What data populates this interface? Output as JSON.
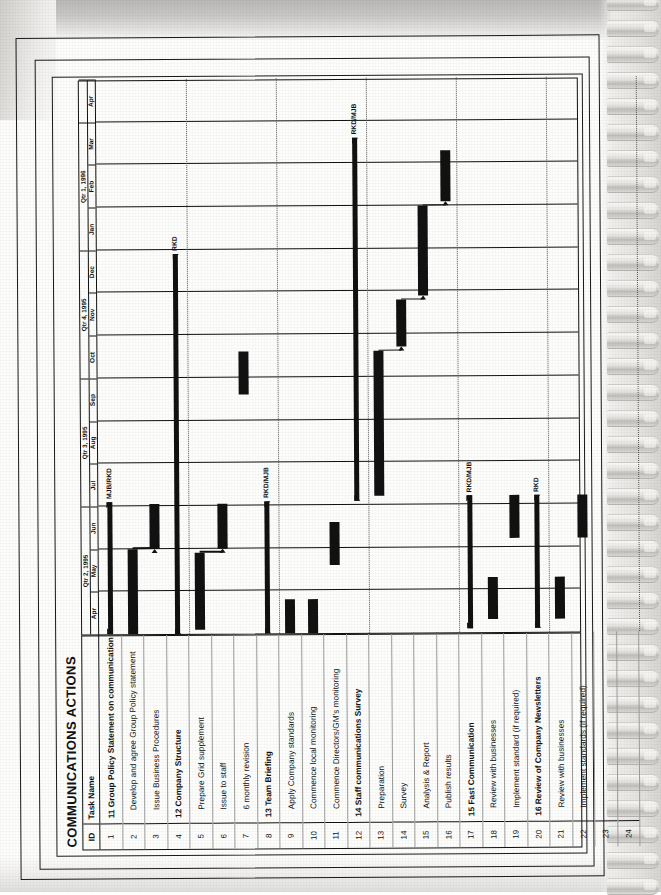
{
  "document": {
    "title": "COMMUNICATIONS ACTIONS",
    "chart_type": "gantt",
    "orientation": "landscape-rotated"
  },
  "table": {
    "columns": [
      "ID",
      "Task Name"
    ],
    "rows": [
      {
        "id": "1",
        "name": "11 Group Policy Statement on communication",
        "kind": "summary"
      },
      {
        "id": "2",
        "name": "Develop and agree Group Policy statement",
        "kind": "task"
      },
      {
        "id": "3",
        "name": "Issue Business Procedures",
        "kind": "task"
      },
      {
        "id": "4",
        "name": "12 Company Structure",
        "kind": "summary"
      },
      {
        "id": "5",
        "name": "Prepare Grid supplement",
        "kind": "task"
      },
      {
        "id": "6",
        "name": "Issue to staff",
        "kind": "task"
      },
      {
        "id": "7",
        "name": "6 monthly revision",
        "kind": "task"
      },
      {
        "id": "8",
        "name": "13 Team Briefing",
        "kind": "summary"
      },
      {
        "id": "9",
        "name": "Apply Company standards",
        "kind": "task"
      },
      {
        "id": "10",
        "name": "Commence local monitoring",
        "kind": "task"
      },
      {
        "id": "11",
        "name": "Commence Directors/GM's monitoring",
        "kind": "task"
      },
      {
        "id": "12",
        "name": "14 Staff communications Survey",
        "kind": "summary"
      },
      {
        "id": "13",
        "name": "Preparation",
        "kind": "task"
      },
      {
        "id": "14",
        "name": "Survey",
        "kind": "task"
      },
      {
        "id": "15",
        "name": "Analysis & Report",
        "kind": "task"
      },
      {
        "id": "16",
        "name": "Publish results",
        "kind": "task"
      },
      {
        "id": "17",
        "name": "15 Fast Communication",
        "kind": "summary"
      },
      {
        "id": "18",
        "name": "Review with businesses",
        "kind": "task"
      },
      {
        "id": "19",
        "name": "Implement standard (if required)",
        "kind": "task"
      },
      {
        "id": "20",
        "name": "16 Review of Company Newsletters",
        "kind": "summary"
      },
      {
        "id": "21",
        "name": "Review with businesses",
        "kind": "task"
      },
      {
        "id": "22",
        "name": "Implement standards (if required)",
        "kind": "task"
      },
      {
        "id": "23",
        "name": "",
        "kind": "empty"
      },
      {
        "id": "24",
        "name": "",
        "kind": "empty"
      }
    ]
  },
  "timeline": {
    "quarters": [
      {
        "label": "Qtr 2, 1995",
        "months": 3
      },
      {
        "label": "Qtr 3, 1995",
        "months": 3
      },
      {
        "label": "Qtr 4, 1995",
        "months": 3
      },
      {
        "label": "Qtr 1, 1996",
        "months": 3
      },
      {
        "label": "",
        "months": 1
      }
    ],
    "months": [
      "Apr",
      "May",
      "Jun",
      "Jul",
      "Aug",
      "Sep",
      "Oct",
      "Nov",
      "Dec",
      "Jan",
      "Feb",
      "Mar",
      "Apr"
    ],
    "units": 13
  },
  "chart_data": {
    "type": "gantt",
    "title": "COMMUNICATIONS ACTIONS",
    "xlabel": "",
    "ylabel": "",
    "x_axis": {
      "unit": "month",
      "ticks": [
        "Apr",
        "May",
        "Jun",
        "Jul",
        "Aug",
        "Sep",
        "Oct",
        "Nov",
        "Dec",
        "Jan",
        "Feb",
        "Mar",
        "Apr"
      ],
      "groups": [
        "Qtr 2, 1995",
        "Qtr 3, 1995",
        "Qtr 4, 1995",
        "Qtr 1, 1996",
        ""
      ],
      "range_months": [
        0,
        13
      ]
    },
    "grid": "dotted-horizontal-per-quarter, solid-vertical-per-month",
    "legend": "none",
    "bars": [
      {
        "row": 1,
        "id": "1",
        "name": "11 Group Policy Statement on communication",
        "kind": "summary",
        "start": 0.0,
        "end": 3.1,
        "resource": "MJB/RKD"
      },
      {
        "row": 2,
        "id": "2",
        "name": "Develop and agree Group Policy statement",
        "kind": "task",
        "start": 0.0,
        "end": 2.0,
        "resource": ""
      },
      {
        "row": 3,
        "id": "3",
        "name": "Issue Business Procedures",
        "kind": "task",
        "start": 2.0,
        "end": 3.05,
        "resource": ""
      },
      {
        "row": 4,
        "id": "4",
        "name": "12 Company Structure",
        "kind": "summary",
        "start": 0.0,
        "end": 8.9,
        "resource": "RKD"
      },
      {
        "row": 5,
        "id": "5",
        "name": "Prepare Grid supplement",
        "kind": "task",
        "start": 0.1,
        "end": 1.9,
        "resource": ""
      },
      {
        "row": 6,
        "id": "6",
        "name": "Issue to staff",
        "kind": "task",
        "start": 2.0,
        "end": 3.05,
        "resource": ""
      },
      {
        "row": 7,
        "id": "7",
        "name": "6 monthly revision",
        "kind": "task",
        "start": 5.6,
        "end": 6.6,
        "resource": ""
      },
      {
        "row": 8,
        "id": "8",
        "name": "13 Team Briefing",
        "kind": "summary",
        "start": 0.0,
        "end": 3.1,
        "resource": "RKD/MJB"
      },
      {
        "row": 9,
        "id": "9",
        "name": "Apply Company standards",
        "kind": "task",
        "start": 0.0,
        "end": 0.8,
        "resource": ""
      },
      {
        "row": 10,
        "id": "10",
        "name": "Commence local monitoring",
        "kind": "task",
        "start": 0.0,
        "end": 0.8,
        "resource": ""
      },
      {
        "row": 11,
        "id": "11",
        "name": "Commence Directors/GM's monitoring",
        "kind": "task",
        "start": 1.6,
        "end": 2.6,
        "resource": ""
      },
      {
        "row": 12,
        "id": "12",
        "name": "14 Staff communications Survey",
        "kind": "summary",
        "start": 3.1,
        "end": 11.6,
        "resource": "RKD/MJB"
      },
      {
        "row": 13,
        "id": "13",
        "name": "Preparation",
        "kind": "task",
        "start": 3.2,
        "end": 6.6,
        "resource": ""
      },
      {
        "row": 14,
        "id": "14",
        "name": "Survey",
        "kind": "task",
        "start": 6.7,
        "end": 7.8,
        "resource": ""
      },
      {
        "row": 15,
        "id": "15",
        "name": "Analysis & Report",
        "kind": "task",
        "start": 7.9,
        "end": 10.0,
        "resource": ""
      },
      {
        "row": 16,
        "id": "16",
        "name": "Publish results",
        "kind": "task",
        "start": 10.1,
        "end": 11.3,
        "resource": ""
      },
      {
        "row": 17,
        "id": "17",
        "name": "15 Fast Communication",
        "kind": "summary",
        "start": 0.1,
        "end": 3.2,
        "resource": "RKD/MJB"
      },
      {
        "row": 18,
        "id": "18",
        "name": "Review with businesses",
        "kind": "task",
        "start": 0.3,
        "end": 1.3,
        "resource": ""
      },
      {
        "row": 19,
        "id": "19",
        "name": "Implement standard (if required)",
        "kind": "task",
        "start": 2.2,
        "end": 3.2,
        "resource": ""
      },
      {
        "row": 20,
        "id": "20",
        "name": "16 Review of Company Newsletters",
        "kind": "summary",
        "start": 0.1,
        "end": 3.2,
        "resource": "RKD"
      },
      {
        "row": 21,
        "id": "21",
        "name": "Review with businesses",
        "kind": "task",
        "start": 0.3,
        "end": 1.3,
        "resource": ""
      },
      {
        "row": 22,
        "id": "22",
        "name": "Implement standards (if required)",
        "kind": "task",
        "start": 2.2,
        "end": 3.2,
        "resource": ""
      }
    ],
    "links": [
      {
        "from_row": 2,
        "to_row": 3
      },
      {
        "from_row": 5,
        "to_row": 6
      },
      {
        "from_row": 13,
        "to_row": 14
      },
      {
        "from_row": 14,
        "to_row": 15
      },
      {
        "from_row": 15,
        "to_row": 16
      }
    ]
  },
  "colors": {
    "bar": "#111111",
    "grid": "#9a9a9a",
    "paper": "#fdfdfc",
    "ink": "#111111"
  }
}
